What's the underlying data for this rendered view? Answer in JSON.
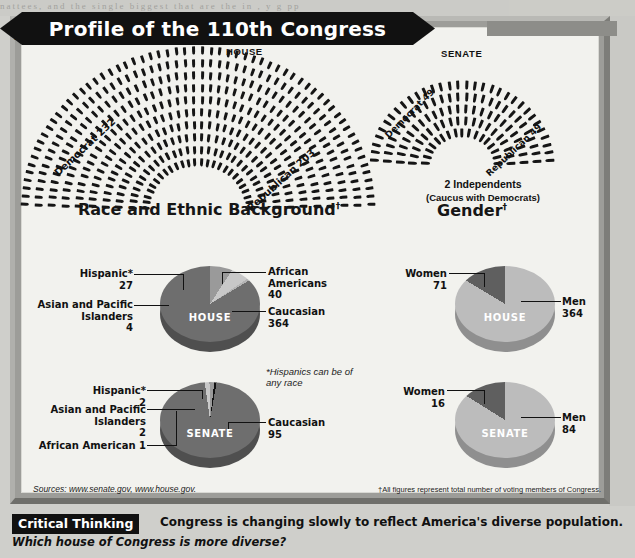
{
  "title": "Profile of the 110th Congress",
  "sections": {
    "party_affiliation": {
      "heading": "Party Affiliation",
      "house": {
        "chamber": "HOUSE",
        "democrat": "Democrat 232",
        "republican": "Republican 203"
      },
      "senate": {
        "chamber": "SENATE",
        "democrat": "Democrat 49",
        "republican": "Republican 49",
        "independents": "2 Independents",
        "independents_note": "(Caucus with Democrats)"
      }
    },
    "race": {
      "heading": "Race and Ethnic Background",
      "heading_dagger": "†",
      "note": "*Hispanics can be of any race",
      "house": {
        "chamber": "HOUSE",
        "hispanic_label": "Hispanic*",
        "hispanic_value": "27",
        "asian_label": "Asian and Pacific Islanders",
        "asian_value": "4",
        "african_label": "African Americans",
        "african_value": "40",
        "caucasian_label": "Caucasian",
        "caucasian_value": "364"
      },
      "senate": {
        "chamber": "SENATE",
        "hispanic_label": "Hispanic*",
        "hispanic_value": "2",
        "asian_label": "Asian and Pacific Islanders",
        "asian_value": "2",
        "african_label": "African American 1",
        "caucasian_label": "Caucasian",
        "caucasian_value": "95"
      }
    },
    "gender": {
      "heading": "Gender",
      "heading_dagger": "†",
      "house": {
        "chamber": "HOUSE",
        "women_label": "Women",
        "women_value": "71",
        "men_label": "Men",
        "men_value": "364"
      },
      "senate": {
        "chamber": "SENATE",
        "women_label": "Women",
        "women_value": "16",
        "men_label": "Men",
        "men_value": "84"
      }
    }
  },
  "sources": "Sources: www.senate.gov, www.house.gov.",
  "footnote": "†All figures represent total number of voting members of Congress.",
  "critical_thinking": {
    "badge": "Critical Thinking",
    "statement": "Congress is changing slowly to reflect America's diverse population.",
    "question": "Which house of Congress is more diverse?"
  },
  "bleed_text": "nattees, and the single biggest  that are the  in ,   y     g     pp",
  "colors": {
    "banner_bg": "#111111",
    "frame": "#9d9d99",
    "panel_bg": "#f2f2ee",
    "dark_slice": "#6e6e6e",
    "mid_slice": "#9a9a9a",
    "light_slice": "#c8c8c8",
    "seat": "#151515"
  },
  "chart_data": [
    {
      "type": "pie",
      "title": "Race and Ethnic Background — HOUSE",
      "categories": [
        "Caucasian",
        "African Americans",
        "Hispanic*",
        "Asian and Pacific Islanders"
      ],
      "values": [
        364,
        40,
        27,
        4
      ],
      "legend": "callouts",
      "total": 435
    },
    {
      "type": "pie",
      "title": "Race and Ethnic Background — SENATE",
      "categories": [
        "Caucasian",
        "Hispanic*",
        "Asian and Pacific Islanders",
        "African American"
      ],
      "values": [
        95,
        2,
        2,
        1
      ],
      "legend": "callouts",
      "total": 100
    },
    {
      "type": "pie",
      "title": "Gender — HOUSE",
      "categories": [
        "Men",
        "Women"
      ],
      "values": [
        364,
        71
      ],
      "legend": "callouts",
      "total": 435
    },
    {
      "type": "pie",
      "title": "Gender — SENATE",
      "categories": [
        "Men",
        "Women"
      ],
      "values": [
        84,
        16
      ],
      "legend": "callouts",
      "total": 100
    },
    {
      "type": "bar",
      "title": "Party Affiliation — HOUSE seats",
      "categories": [
        "Democrat",
        "Republican"
      ],
      "values": [
        232,
        203
      ],
      "total": 435
    },
    {
      "type": "bar",
      "title": "Party Affiliation — SENATE seats",
      "categories": [
        "Democrat",
        "Republican",
        "Independents"
      ],
      "values": [
        49,
        49,
        2
      ],
      "total": 100
    }
  ]
}
